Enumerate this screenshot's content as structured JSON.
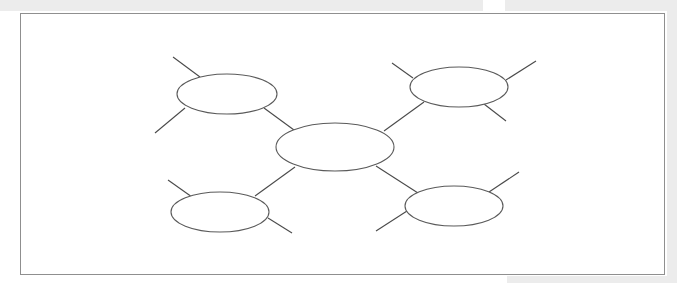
{
  "diagram": {
    "type": "spider-map",
    "stroke_color": "#5a5a5a",
    "frame_color": "#8f8f8f",
    "background_band_color": "#ececec",
    "nodes": [
      {
        "id": "center",
        "label": "",
        "cx": 335,
        "cy": 147,
        "rx": 59,
        "ry": 24
      },
      {
        "id": "top-left",
        "label": "",
        "cx": 227,
        "cy": 94,
        "rx": 50,
        "ry": 20
      },
      {
        "id": "top-right",
        "label": "",
        "cx": 459,
        "cy": 87,
        "rx": 49,
        "ry": 20
      },
      {
        "id": "bottom-left",
        "label": "",
        "cx": 220,
        "cy": 212,
        "rx": 49,
        "ry": 20
      },
      {
        "id": "bottom-right",
        "label": "",
        "cx": 454,
        "cy": 206,
        "rx": 49,
        "ry": 20
      }
    ],
    "connectors": [
      {
        "from": "center",
        "to": "top-left",
        "x1": 294,
        "y1": 130,
        "x2": 264,
        "y2": 108
      },
      {
        "from": "center",
        "to": "top-right",
        "x1": 384,
        "y1": 131,
        "x2": 424,
        "y2": 102
      },
      {
        "from": "center",
        "to": "bottom-left",
        "x1": 295,
        "y1": 167,
        "x2": 255,
        "y2": 196
      },
      {
        "from": "center",
        "to": "bottom-right",
        "x1": 376,
        "y1": 166,
        "x2": 418,
        "y2": 193
      }
    ],
    "spokes": [
      {
        "node": "top-left",
        "x1": 173,
        "y1": 57,
        "x2": 200,
        "y2": 77
      },
      {
        "node": "top-left",
        "x1": 155,
        "y1": 133,
        "x2": 185,
        "y2": 108
      },
      {
        "node": "top-right",
        "x1": 392,
        "y1": 63,
        "x2": 413,
        "y2": 78
      },
      {
        "node": "top-right",
        "x1": 506,
        "y1": 80,
        "x2": 536,
        "y2": 61
      },
      {
        "node": "top-right",
        "x1": 484,
        "y1": 104,
        "x2": 506,
        "y2": 121
      },
      {
        "node": "bottom-left",
        "x1": 168,
        "y1": 180,
        "x2": 192,
        "y2": 197
      },
      {
        "node": "bottom-left",
        "x1": 268,
        "y1": 218,
        "x2": 292,
        "y2": 233
      },
      {
        "node": "bottom-right",
        "x1": 489,
        "y1": 192,
        "x2": 519,
        "y2": 172
      },
      {
        "node": "bottom-right",
        "x1": 376,
        "y1": 231,
        "x2": 407,
        "y2": 211
      }
    ]
  }
}
